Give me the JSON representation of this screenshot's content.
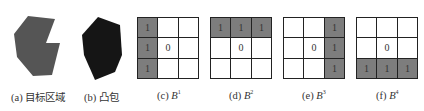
{
  "panels": [
    {
      "id": "a",
      "label": "(a)",
      "caption": "目标区域",
      "kind": "polygon",
      "fill": "#555555",
      "points": "28,16 55,19 46,43 60,43 52,75 33,76 17,57 14,34"
    },
    {
      "id": "b",
      "label": "(b)",
      "caption": "凸包",
      "kind": "polygon",
      "fill": "#151515",
      "points": "98,17 120,25 122,55 115,72 95,80 84,55 82,35"
    },
    {
      "id": "c",
      "label": "(c)",
      "symbol": "B",
      "sup": "1",
      "kind": "grid",
      "cells": [
        "1",
        "",
        "",
        "1",
        "0",
        "",
        "1",
        "",
        ""
      ],
      "on": [
        1,
        0,
        0,
        1,
        0,
        0,
        1,
        0,
        0
      ]
    },
    {
      "id": "d",
      "label": "(d)",
      "symbol": "B",
      "sup": "2",
      "kind": "grid",
      "cells": [
        "1",
        "1",
        "1",
        "",
        "0",
        "",
        "",
        "",
        ""
      ],
      "on": [
        1,
        1,
        1,
        0,
        0,
        0,
        0,
        0,
        0
      ]
    },
    {
      "id": "e",
      "label": "(e)",
      "symbol": "B",
      "sup": "3",
      "kind": "grid",
      "cells": [
        "",
        "",
        "1",
        "",
        "0",
        "1",
        "",
        "",
        "1"
      ],
      "on": [
        0,
        0,
        1,
        0,
        0,
        1,
        0,
        0,
        1
      ]
    },
    {
      "id": "f",
      "label": "(f)",
      "symbol": "B",
      "sup": "4",
      "kind": "grid",
      "cells": [
        "",
        "",
        "",
        "",
        "0",
        "",
        "1",
        "1",
        "1"
      ],
      "on": [
        0,
        0,
        0,
        0,
        0,
        0,
        1,
        1,
        1
      ]
    }
  ],
  "colors": {
    "active_cell": "#7d7d7d",
    "grid_line": "#222222"
  }
}
